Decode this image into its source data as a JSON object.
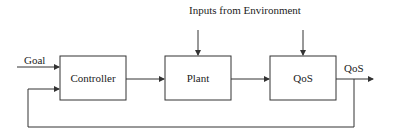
{
  "diagram": {
    "title_label": "Inputs from Environment",
    "input_label": "Goal",
    "output_label": "QoS",
    "blocks": [
      {
        "id": "controller",
        "label": "Controller"
      },
      {
        "id": "plant",
        "label": "Plant"
      },
      {
        "id": "qos",
        "label": "QoS"
      }
    ],
    "colors": {
      "line": "#333333",
      "background": "#ffffff"
    }
  }
}
